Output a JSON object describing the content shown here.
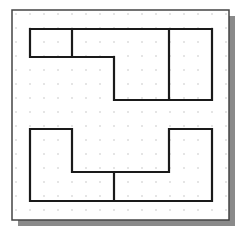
{
  "diagram": {
    "type": "grid-sketch",
    "frame": {
      "x": 12,
      "y": 10,
      "width": 217,
      "height": 210,
      "border_color": "#444444",
      "shadow_color": "#8a8a8a",
      "shadow_offset": 6
    },
    "grid": {
      "spacing": 14,
      "dot_color": "#b8b8b8",
      "origin_x": 16,
      "origin_y": 14
    },
    "line_color": "#1a1a1a",
    "top_figure": {
      "outline": "30,29 212,29 212,100 114,100 114,57 30,57",
      "dividers": [
        {
          "x1": 72,
          "y1": 29,
          "x2": 72,
          "y2": 57
        },
        {
          "x1": 169,
          "y1": 29,
          "x2": 169,
          "y2": 100
        }
      ]
    },
    "bottom_figure": {
      "outline": "30,129 72,129 72,172 169,172 169,129 212,129 212,201 30,201",
      "dividers": [
        {
          "x1": 114,
          "y1": 172,
          "x2": 114,
          "y2": 201
        }
      ]
    }
  }
}
